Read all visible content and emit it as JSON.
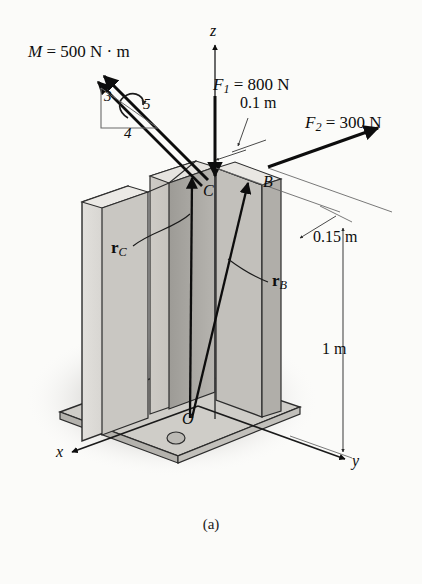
{
  "figure": {
    "caption": "(a)",
    "background_color": "#fbfbf9",
    "line_color": "#101010"
  },
  "axes": [
    {
      "name": "z-axis",
      "label": "z",
      "x": 210,
      "y": 30
    },
    {
      "name": "x-axis",
      "label": "x",
      "x": 56,
      "y": 452
    },
    {
      "name": "y-axis",
      "label": "y",
      "x": 352,
      "y": 461
    }
  ],
  "points": [
    {
      "name": "point-O",
      "label": "O",
      "x": 182,
      "y": 419
    },
    {
      "name": "point-B",
      "label": "B",
      "x": 263,
      "y": 182
    },
    {
      "name": "point-C",
      "label": "C",
      "x": 203,
      "y": 191
    }
  ],
  "loads": [
    {
      "name": "moment-label",
      "label": "M = 500 N · m",
      "x": 28,
      "y": 52,
      "color": "#000000"
    },
    {
      "name": "force-f1-label",
      "prefix": "F",
      "subscript": "1",
      "value": " = 800 N",
      "x": 213,
      "y": 85
    },
    {
      "name": "force-f2-label",
      "prefix": "F",
      "subscript": "2",
      "value": " = 300 N",
      "x": 305,
      "y": 123
    }
  ],
  "slope_triangle": {
    "name": "slope-triangle-3-4-5",
    "rise": "3",
    "run": "4",
    "hyp": "5",
    "rise_pos": {
      "x": 104,
      "y": 98
    },
    "run_pos": {
      "x": 124,
      "y": 135
    },
    "hyp_pos": {
      "x": 143,
      "y": 105
    }
  },
  "dimensions": [
    {
      "name": "dimension-0-1m",
      "label": "0.1 m",
      "x": 247,
      "y": 104
    },
    {
      "name": "dimension-0-15m",
      "label": "0.15 m",
      "x": 313,
      "y": 237
    },
    {
      "name": "dimension-1m",
      "label": "1 m",
      "x": 322,
      "y": 350
    }
  ],
  "vectors": [
    {
      "name": "position-vector-rc",
      "symbol": "r",
      "subscript": "C",
      "x": 111,
      "y": 248
    },
    {
      "name": "position-vector-rb",
      "symbol": "r",
      "subscript": "B",
      "x": 240,
      "y": 281
    }
  ],
  "structure": {
    "column_name": "i-beam-column",
    "baseplate_name": "base-plate",
    "bolt_count": 4,
    "shadow_name": "ground-shadow",
    "colors": {
      "flange_light": "#d8d6d2",
      "flange_mid": "#bfbdb8",
      "web_dark": "#a8a6a1",
      "plate": "#cfcdc8",
      "plate_edge": "#b4b2ad",
      "shadow": "#c9c7c4"
    }
  }
}
